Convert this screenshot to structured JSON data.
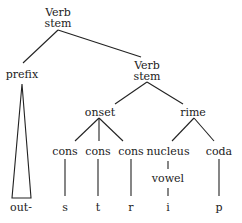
{
  "diagram": {
    "type": "syntax-tree",
    "nodes": {
      "root": {
        "line1": "Verb",
        "line2": "stem"
      },
      "prefix": {
        "label": "prefix"
      },
      "stem": {
        "line1": "Verb",
        "line2": "stem"
      },
      "onset": {
        "label": "onset"
      },
      "rime": {
        "label": "rime"
      },
      "cons1": {
        "label": "cons"
      },
      "cons2": {
        "label": "cons"
      },
      "cons3": {
        "label": "cons"
      },
      "nucleus": {
        "label": "nucleus"
      },
      "coda": {
        "label": "coda"
      },
      "vowel": {
        "label": "vowel"
      }
    },
    "leaves": {
      "out": "out-",
      "s": "s",
      "t": "t",
      "r": "r",
      "i": "i",
      "p": "p"
    },
    "edges": [
      [
        "root",
        "prefix"
      ],
      [
        "root",
        "stem"
      ],
      [
        "prefix",
        "out (triangle)"
      ],
      [
        "stem",
        "onset"
      ],
      [
        "stem",
        "rime"
      ],
      [
        "onset",
        "cons1"
      ],
      [
        "onset",
        "cons2"
      ],
      [
        "onset",
        "cons3"
      ],
      [
        "rime",
        "nucleus"
      ],
      [
        "rime",
        "coda"
      ],
      [
        "cons1",
        "s"
      ],
      [
        "cons2",
        "t"
      ],
      [
        "cons3",
        "r"
      ],
      [
        "nucleus",
        "vowel"
      ],
      [
        "vowel",
        "i"
      ],
      [
        "coda",
        "p"
      ]
    ],
    "colors": {
      "ink": "#222222",
      "background": "#ffffff"
    }
  }
}
